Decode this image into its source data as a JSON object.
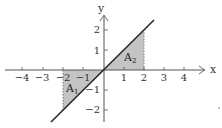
{
  "diagram": {
    "function": "y = x",
    "x_axis": {
      "label": "x",
      "ticks": [
        "−4",
        "−3",
        "−2",
        "−1",
        "1",
        "2",
        "3",
        "4"
      ],
      "values": [
        -4,
        -3,
        -2,
        -1,
        1,
        2,
        3,
        4
      ]
    },
    "y_axis": {
      "label": "y",
      "ticks": [
        "2",
        "1",
        "−1",
        "−2"
      ],
      "values": [
        2,
        1,
        -1,
        -2
      ]
    },
    "regions": [
      {
        "name": "A",
        "subscript": "1",
        "from_x": -2,
        "to_x": 0,
        "description": "shaded region between y=x and x-axis for -2 ≤ x ≤ 0"
      },
      {
        "name": "A",
        "subscript": "2",
        "from_x": 0,
        "to_x": 2,
        "description": "shaded region between y=x and x-axis for 0 ≤ x ≤ 2"
      }
    ],
    "colors": {
      "shade": "#bdbdbd",
      "line": "#2a2a2a",
      "axis": "#555555"
    }
  }
}
